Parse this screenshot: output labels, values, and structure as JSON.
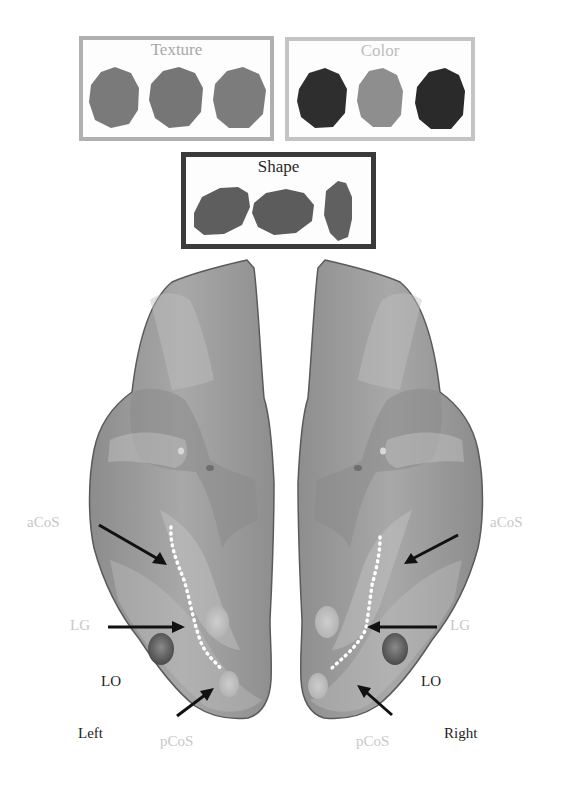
{
  "feature_boxes": {
    "texture": {
      "title": "Texture",
      "border_color": "#b0b0b0",
      "title_color": "#a8a8a8",
      "blob_colors": [
        "#7a7a7a",
        "#767676",
        "#7c7c7c"
      ]
    },
    "color": {
      "title": "Color",
      "border_color": "#c4c4c4",
      "title_color": "#bdbdbd",
      "blob_colors": [
        "#2e2e2e",
        "#8e8e8e",
        "#2a2a2a"
      ]
    },
    "shape": {
      "title": "Shape",
      "border_color": "#3a3a3a",
      "title_color": "#2a2a2a",
      "blob_colors": [
        "#5e5e5e",
        "#5c5c5c",
        "#606060"
      ]
    }
  },
  "hemispheres": {
    "left": {
      "label": "Left"
    },
    "right": {
      "label": "Right"
    }
  },
  "region_labels": {
    "left": {
      "acos": "aCoS",
      "lg": "LG",
      "lo": "LO",
      "pcos": "pCoS"
    },
    "right": {
      "acos": "aCoS",
      "lg": "LG",
      "lo": "LO",
      "pcos": "pCoS"
    }
  },
  "colors": {
    "light_label": "#c8c8c8",
    "dark_label": "#1e1e1e",
    "cortex": "#9c9c9c",
    "arrow": "#111111"
  }
}
